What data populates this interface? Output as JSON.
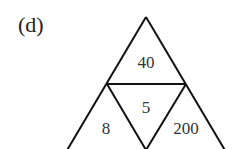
{
  "figure": {
    "label": "(d)",
    "cells": {
      "top": "40",
      "center": "5",
      "left": "8",
      "right": "200"
    },
    "stroke_color": "#111111"
  }
}
